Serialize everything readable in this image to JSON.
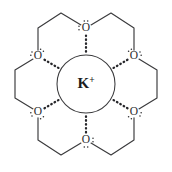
{
  "figure": {
    "background_color": "#ffffff",
    "bond_color": "#3a3a3c",
    "label_color": "#2c2c2e",
    "coordination_color": "#26262a"
  },
  "central_ion": {
    "symbol": "K",
    "charge": "+",
    "name": "potassium-ion",
    "center_x": 86,
    "center_y": 84,
    "radius": 29
  },
  "oxygens": [
    {
      "label": "O",
      "name": "oxygen-top",
      "x": 86,
      "y": 28,
      "lone_pair_side": "top"
    },
    {
      "label": "O",
      "name": "oxygen-upper-right",
      "x": 134,
      "y": 56,
      "lone_pair_side": "top-right"
    },
    {
      "label": "O",
      "name": "oxygen-lower-right",
      "x": 134,
      "y": 112,
      "lone_pair_side": "bottom-right"
    },
    {
      "label": "O",
      "name": "oxygen-bottom",
      "x": 86,
      "y": 140,
      "lone_pair_side": "bottom"
    },
    {
      "label": "O",
      "name": "oxygen-lower-left",
      "x": 38,
      "y": 112,
      "lone_pair_side": "bottom-left"
    },
    {
      "label": "O",
      "name": "oxygen-upper-left",
      "x": 38,
      "y": 56,
      "lone_pair_side": "top-left"
    }
  ],
  "bridges": [
    {
      "name": "bridge-top-right",
      "points": "86,28 111,13 134,28 134,56"
    },
    {
      "name": "bridge-right",
      "points": "134,56 157,70 157,98 134,112"
    },
    {
      "name": "bridge-bottom-right",
      "points": "134,112 134,140 111,155 86,140"
    },
    {
      "name": "bridge-bottom-left",
      "points": "86,140 61,155 38,140 38,112"
    },
    {
      "name": "bridge-left",
      "points": "38,112 15,98 15,70 38,56"
    },
    {
      "name": "bridge-top-left",
      "points": "38,56 38,28 61,13 86,28"
    }
  ],
  "coordination_bonds": [
    {
      "name": "coordination-top",
      "from": "oxygen-top",
      "to": "potassium-ion"
    },
    {
      "name": "coordination-upper-right",
      "from": "oxygen-upper-right",
      "to": "potassium-ion"
    },
    {
      "name": "coordination-lower-right",
      "from": "oxygen-lower-right",
      "to": "potassium-ion"
    },
    {
      "name": "coordination-bottom",
      "from": "oxygen-bottom",
      "to": "potassium-ion"
    },
    {
      "name": "coordination-lower-left",
      "from": "oxygen-lower-left",
      "to": "potassium-ion"
    },
    {
      "name": "coordination-upper-left",
      "from": "oxygen-upper-left",
      "to": "potassium-ion"
    }
  ]
}
